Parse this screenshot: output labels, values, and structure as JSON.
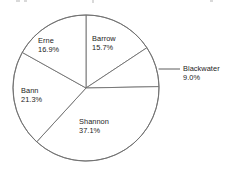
{
  "chart_data": {
    "type": "pie",
    "title": "",
    "subtitle": "",
    "xlabel": "",
    "ylabel": "",
    "legend_position": "labels-on-slices",
    "grid": false,
    "start_angle_deg": 0,
    "direction": "clockwise",
    "unit": "%",
    "categories": [
      "Barrow",
      "Blackwater",
      "Shannon",
      "Bann",
      "Erne"
    ],
    "values": [
      15.7,
      9.0,
      37.1,
      21.3,
      16.9
    ],
    "slices": [
      {
        "name": "Barrow",
        "value": 15.7,
        "value_label": "15.7%",
        "label_placement": "inside",
        "leader_line": false
      },
      {
        "name": "Blackwater",
        "value": 9.0,
        "value_label": "9.0%",
        "label_placement": "outside-right",
        "leader_line": true
      },
      {
        "name": "Shannon",
        "value": 37.1,
        "value_label": "37.1%",
        "label_placement": "inside",
        "leader_line": false
      },
      {
        "name": "Bann",
        "value": 21.3,
        "value_label": "21.3%",
        "label_placement": "inside",
        "leader_line": false
      },
      {
        "name": "Erne",
        "value": 16.9,
        "value_label": "16.9%",
        "label_placement": "inside",
        "leader_line": false
      }
    ]
  },
  "style": {
    "slice_fill": "#ffffff",
    "slice_stroke": "#6f6f6f",
    "leader_stroke": "#4a4a4a",
    "text_color": "#232323",
    "background": "#ffffff"
  }
}
